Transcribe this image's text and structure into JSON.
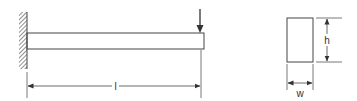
{
  "diagram": {
    "type": "cantilever-beam",
    "beam": {
      "support": "fixed-wall",
      "load": "point-load-at-free-end",
      "length_label": "l"
    },
    "cross_section": {
      "shape": "rectangle",
      "height_label": "h",
      "width_label": "w"
    },
    "colors": {
      "line": "#444444",
      "background": "#ffffff"
    }
  }
}
